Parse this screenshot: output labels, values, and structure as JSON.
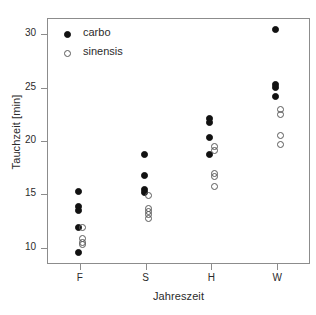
{
  "chart_data": {
    "type": "scatter",
    "title": "",
    "xlabel": "Jahreszeit",
    "ylabel": "Tauchzeit [min]",
    "categories": [
      "F",
      "S",
      "H",
      "W"
    ],
    "xtick_labels": [
      "F",
      "S",
      "H",
      "W"
    ],
    "ytick_labels": [
      "10",
      "15",
      "20",
      "25",
      "30"
    ],
    "ytick_values": [
      10,
      15,
      20,
      25,
      30
    ],
    "ylim": [
      8.5,
      31.5
    ],
    "grid": false,
    "legend_position": "top-left",
    "colors": {
      "carbo": "#111111",
      "sinensis": "#ffffff",
      "marker_edge": "#5a5a5a",
      "axis": "#8c8c8c",
      "text": "#2b2b2b",
      "background": "#ffffff"
    },
    "series": [
      {
        "name": "carbo",
        "marker": "filled-circle",
        "points": [
          {
            "category": "F",
            "value": 15.3
          },
          {
            "category": "F",
            "value": 13.9
          },
          {
            "category": "F",
            "value": 13.5
          },
          {
            "category": "F",
            "value": 11.9
          },
          {
            "category": "F",
            "value": 9.6
          },
          {
            "category": "S",
            "value": 18.7
          },
          {
            "category": "S",
            "value": 16.8
          },
          {
            "category": "S",
            "value": 15.5
          },
          {
            "category": "S",
            "value": 15.2
          },
          {
            "category": "H",
            "value": 22.1
          },
          {
            "category": "H",
            "value": 21.7
          },
          {
            "category": "H",
            "value": 20.3
          },
          {
            "category": "H",
            "value": 18.7
          },
          {
            "category": "W",
            "value": 30.4
          },
          {
            "category": "W",
            "value": 25.3
          },
          {
            "category": "W",
            "value": 25.0
          },
          {
            "category": "W",
            "value": 24.2
          }
        ]
      },
      {
        "name": "sinensis",
        "marker": "open-circle",
        "points": [
          {
            "category": "F",
            "value": 11.9
          },
          {
            "category": "F",
            "value": 10.9
          },
          {
            "category": "F",
            "value": 10.5
          },
          {
            "category": "F",
            "value": 10.3
          },
          {
            "category": "S",
            "value": 14.9
          },
          {
            "category": "S",
            "value": 13.7
          },
          {
            "category": "S",
            "value": 13.4
          },
          {
            "category": "S",
            "value": 13.1
          },
          {
            "category": "S",
            "value": 12.8
          },
          {
            "category": "H",
            "value": 19.5
          },
          {
            "category": "H",
            "value": 19.1
          },
          {
            "category": "H",
            "value": 17.0
          },
          {
            "category": "H",
            "value": 16.7
          },
          {
            "category": "H",
            "value": 15.7
          },
          {
            "category": "W",
            "value": 22.9
          },
          {
            "category": "W",
            "value": 22.5
          },
          {
            "category": "W",
            "value": 20.5
          },
          {
            "category": "W",
            "value": 19.7
          }
        ]
      }
    ],
    "legend": [
      {
        "label": "carbo",
        "marker": "filled-circle"
      },
      {
        "label": "sinensis",
        "marker": "open-circle"
      }
    ]
  }
}
